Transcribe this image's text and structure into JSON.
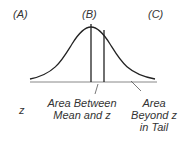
{
  "columns": {
    "a": "(A)",
    "b": "(B)",
    "c": "(C)"
  },
  "row_label": "z",
  "area_between": {
    "line1": "Area Between",
    "line2": "Mean and z"
  },
  "area_beyond": {
    "line1": "Area",
    "line2": "Beyond z",
    "line3": "in Tail"
  },
  "colors": {
    "stroke": "#222222",
    "baseline": "#888888",
    "text": "#333333"
  }
}
